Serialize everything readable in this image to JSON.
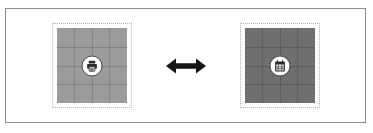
{
  "figure": {
    "type": "comparison-diagram",
    "frame_border_color": "#8e8e8e",
    "background_color": "#ffffff"
  },
  "panels": [
    {
      "id": "left-tile",
      "label": "light-texture-tile",
      "fill_color": "#9b9b9b",
      "grid_columns": 4,
      "grid_rows": 4,
      "grid_line_color": "rgba(0,0,0,0.16)",
      "border_style": "dotted",
      "border_color": "#b5b5b5",
      "badge": {
        "icon": "printer-icon",
        "circle_fill": "#ffffff",
        "circle_stroke": "#4a4a4a",
        "glyph_color": "#2b2b2b"
      }
    },
    {
      "id": "right-tile",
      "label": "dark-texture-tile",
      "fill_color": "#6f6f6f",
      "grid_columns": 4,
      "grid_rows": 4,
      "grid_line_color": "rgba(0,0,0,0.16)",
      "border_style": "dotted",
      "border_color": "#b5b5b5",
      "badge": {
        "icon": "calendar-icon",
        "circle_fill": "#ffffff",
        "circle_stroke": "#4a4a4a",
        "glyph_color": "#2b2b2b"
      }
    }
  ],
  "connector": {
    "icon": "double-arrow-horizontal-icon",
    "color": "#151515",
    "meaning": "exchange"
  }
}
